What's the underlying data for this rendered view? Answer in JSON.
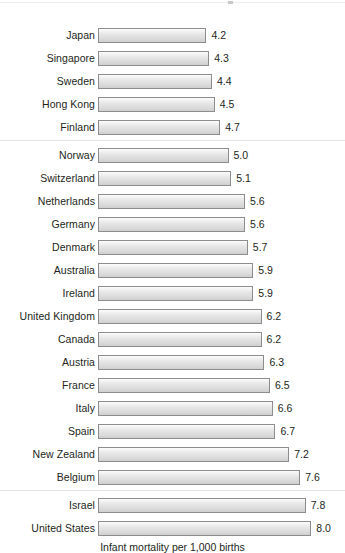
{
  "chart_data": {
    "type": "bar",
    "orientation": "horizontal",
    "title": "",
    "subtitle": "",
    "xlabel": "Infant mortality per 1,000 births",
    "ylabel": "",
    "grid": false,
    "legend": null,
    "xlim": [
      0,
      8.0
    ],
    "value_format": "one-decimal",
    "categories": [
      "Japan",
      "Singapore",
      "Sweden",
      "Hong Kong",
      "Finland",
      "Norway",
      "Switzerland",
      "Netherlands",
      "Germany",
      "Denmark",
      "Australia",
      "Ireland",
      "United Kingdom",
      "Canada",
      "Austria",
      "France",
      "Italy",
      "Spain",
      "New Zealand",
      "Belgium",
      "Israel",
      "United States"
    ],
    "values": [
      4.2,
      4.3,
      4.4,
      4.5,
      4.7,
      5.0,
      5.1,
      5.6,
      5.6,
      5.7,
      5.9,
      5.9,
      6.2,
      6.2,
      6.3,
      6.5,
      6.6,
      6.7,
      7.2,
      7.6,
      7.8,
      8.0
    ],
    "value_labels": [
      "4.2",
      "4.3",
      "4.4",
      "4.5",
      "4.7",
      "5.0",
      "5.1",
      "5.6",
      "5.6",
      "5.7",
      "5.9",
      "5.9",
      "6.2",
      "6.2",
      "6.3",
      "6.5",
      "6.6",
      "6.7",
      "7.2",
      "7.6",
      "7.8",
      "8.0"
    ],
    "group_separators_after": [
      "Finland",
      "Belgium"
    ],
    "colors": {
      "bar_fill_light": "#fdfdfd",
      "bar_fill_dark": "#cfcfcf",
      "bar_border": "#8d8d8f",
      "text": "#231f20",
      "separator": "#e3e3e5",
      "background": "#ffffff"
    }
  },
  "axis": {
    "title": "Infant mortality per 1,000 births"
  }
}
